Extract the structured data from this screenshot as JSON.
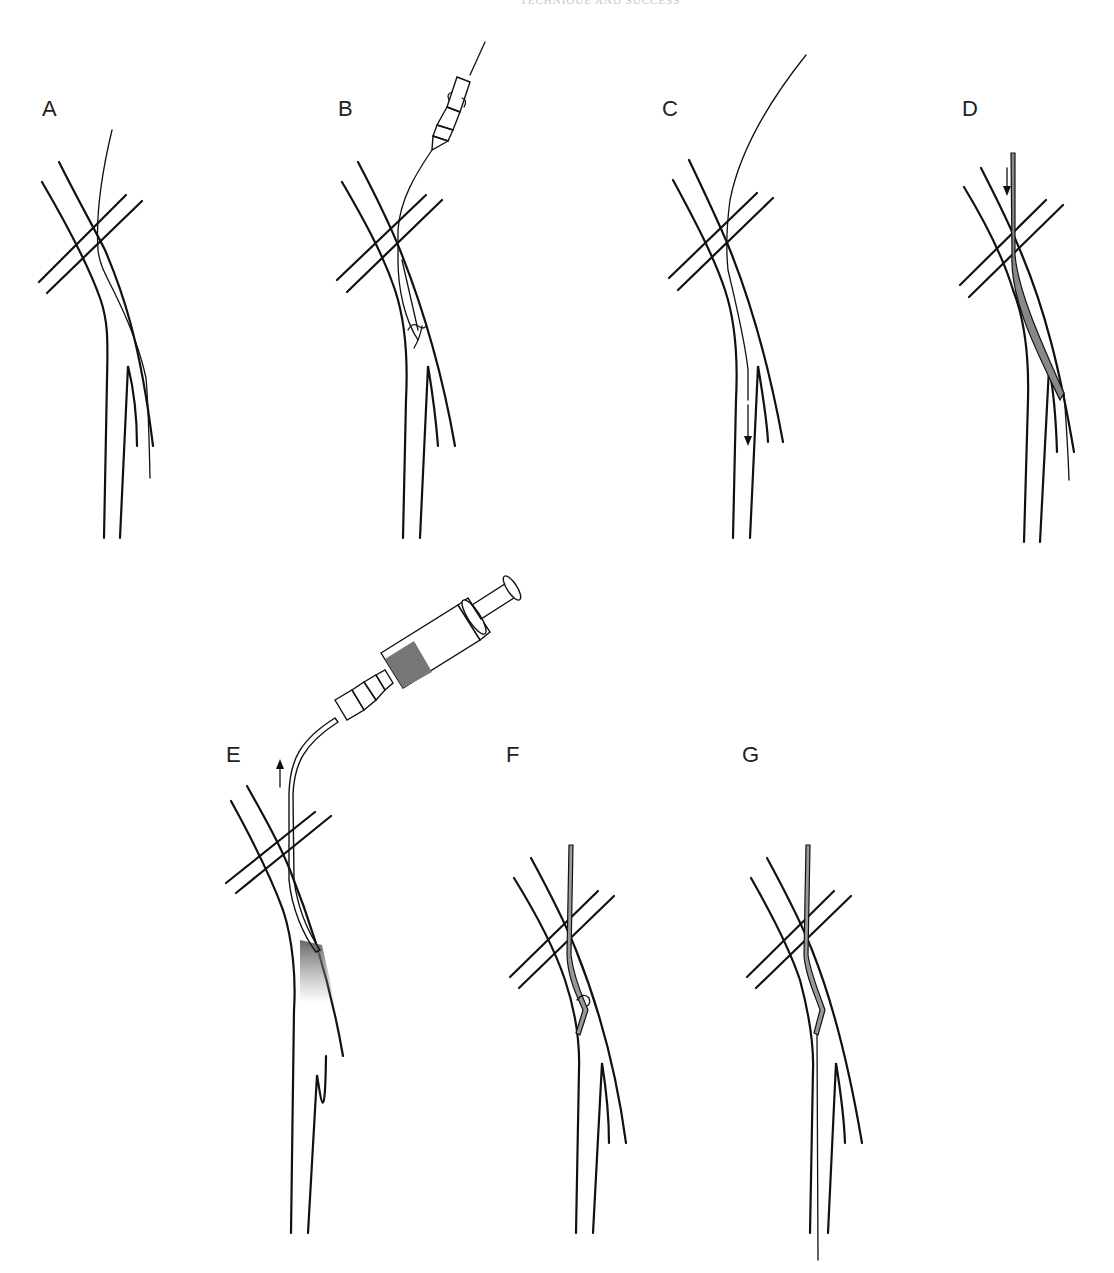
{
  "page": {
    "running_header": "TECHNIQUE AND SUCCESS",
    "background": "#ffffff"
  },
  "figure": {
    "panels": [
      {
        "id": "A",
        "label": "A",
        "description": "Guidewire advanced across the vein crossing into the vessel"
      },
      {
        "id": "B",
        "label": "B",
        "description": "Needle/catheter hub on guidewire, rotation within the vessel"
      },
      {
        "id": "C",
        "label": "C",
        "description": "Guidewire advanced distally (downward arrow)"
      },
      {
        "id": "D",
        "label": "D",
        "description": "Catheter/sheath advanced over wire (downward arrow), shaded catheter"
      },
      {
        "id": "E",
        "label": "E",
        "description": "Syringe attached to catheter; contrast injection, catheter withdrawn (upward arrow)"
      },
      {
        "id": "F",
        "label": "F",
        "description": "Angled catheter tip rotated within vessel"
      },
      {
        "id": "G",
        "label": "G",
        "description": "Wire passed through angled catheter into branch"
      }
    ],
    "colors": {
      "line": "#111111",
      "shading": "#777777",
      "label": "#222222"
    }
  }
}
